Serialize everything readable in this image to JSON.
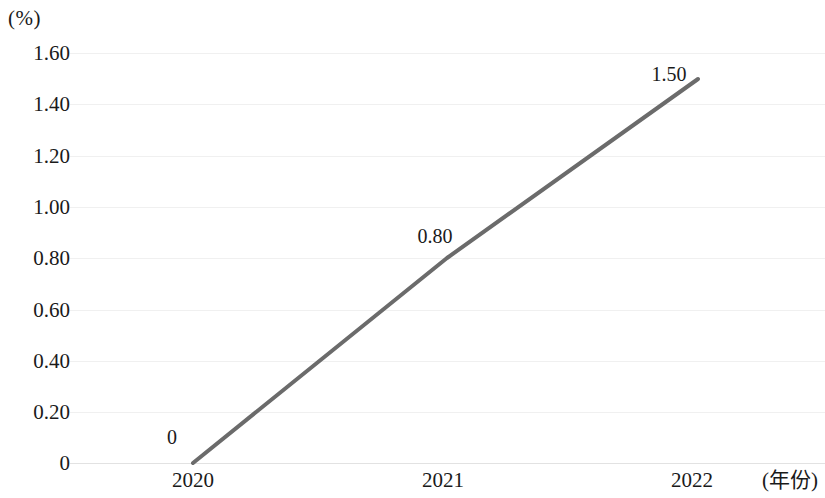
{
  "chart_data": {
    "type": "line",
    "title": "",
    "subtitle": "",
    "xlabel": "(年份)",
    "ylabel": "(%)",
    "categories": [
      "2020",
      "2021",
      "2022"
    ],
    "x": [
      2020,
      2021,
      2022
    ],
    "values": [
      0,
      0.8,
      1.5
    ],
    "point_labels": [
      "0",
      "0.80",
      "1.50"
    ],
    "series": [
      {
        "name": "",
        "values": [
          0,
          0.8,
          1.5
        ]
      }
    ],
    "ylim": [
      0,
      1.6
    ],
    "ytick_values": [
      1.6,
      1.4,
      1.2,
      1.0,
      0.8,
      0.6,
      0.4,
      0.2,
      0
    ],
    "ytick_labels": [
      "1.60",
      "1.40",
      "1.20",
      "1.00",
      "0.80",
      "0.60",
      "0.40",
      "0.20",
      "0"
    ],
    "xtick_labels": [
      "2020",
      "2021",
      "2022"
    ],
    "grid": "horizontal",
    "legend": "none",
    "line_color": "#6b6b6b",
    "grid_color": "#f0f0f0",
    "axis_color": "#e2e2e2",
    "line_width": 4
  },
  "axes": {
    "y_unit_label": "(%)",
    "x_title": "(年份)"
  },
  "yticks": [
    {
      "label": "1.60",
      "value": 1.6,
      "y": 53
    },
    {
      "label": "1.40",
      "value": 1.4,
      "y": 104
    },
    {
      "label": "1.20",
      "value": 1.2,
      "y": 156
    },
    {
      "label": "1.00",
      "value": 1.0,
      "y": 207
    },
    {
      "label": "0.80",
      "value": 0.8,
      "y": 258
    },
    {
      "label": "0.60",
      "value": 0.6,
      "y": 310
    },
    {
      "label": "0.40",
      "value": 0.4,
      "y": 361
    },
    {
      "label": "0.20",
      "value": 0.2,
      "y": 412
    },
    {
      "label": "0",
      "value": 0,
      "y": 463
    }
  ],
  "xticks": [
    {
      "label": "2020",
      "x": 193
    },
    {
      "label": "2021",
      "x": 443
    },
    {
      "label": "2022",
      "x": 692
    }
  ],
  "points": [
    {
      "label": "0",
      "px": 193,
      "py": 463,
      "label_x": 172,
      "label_y": 437
    },
    {
      "label": "0.80",
      "px": 447,
      "py": 258,
      "label_x": 435,
      "label_y": 236
    },
    {
      "label": "1.50",
      "px": 698,
      "py": 79,
      "label_x": 669,
      "label_y": 74
    }
  ],
  "polyline": "193,463 447,258 698,79"
}
